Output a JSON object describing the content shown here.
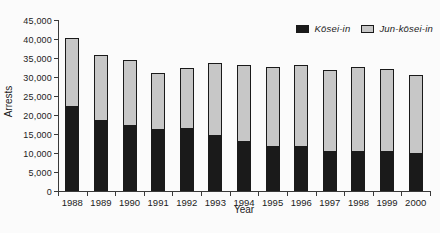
{
  "chart_data": {
    "type": "bar",
    "stacked": true,
    "title": "",
    "xlabel": "Year",
    "ylabel": "Arrests",
    "ylim": [
      0,
      45000
    ],
    "ytick_step": 5000,
    "y_tick_labels": [
      "0",
      "5,000",
      "10,000",
      "15,000",
      "20,000",
      "25,000",
      "30,000",
      "35,000",
      "40,000",
      "45,000"
    ],
    "grid": false,
    "legend_position": "top-right",
    "categories": [
      "1988",
      "1989",
      "1990",
      "1991",
      "1992",
      "1993",
      "1994",
      "1995",
      "1996",
      "1997",
      "1998",
      "1999",
      "2000"
    ],
    "series": [
      {
        "name": "Kōsei-in",
        "color": "#1a1a1a",
        "values": [
          22000,
          18500,
          17000,
          16000,
          16200,
          14500,
          12800,
          11600,
          11700,
          10300,
          10200,
          10300,
          9800
        ]
      },
      {
        "name": "Jun-kōsei-in",
        "color": "#c7c7c7",
        "values": [
          18300,
          17400,
          17400,
          15000,
          16300,
          19100,
          20400,
          21000,
          21400,
          21500,
          22500,
          21900,
          20700
        ]
      }
    ]
  }
}
